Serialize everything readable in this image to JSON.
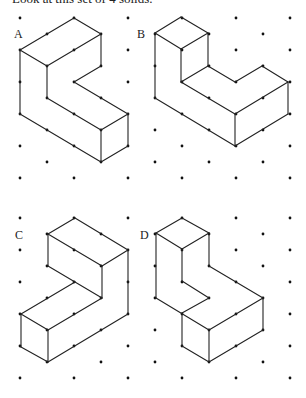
{
  "heading": "Look at this set of 4 solids.",
  "colors": {
    "line": "#222222",
    "dot": "#111111",
    "background": "#ffffff"
  },
  "lattice": {
    "x0": 20,
    "dx": 27,
    "columns": 11,
    "blocks": [
      {
        "y0": 18,
        "rows": 6
      },
      {
        "y0": 218,
        "rows": 6
      }
    ],
    "dy": 32
  },
  "figures": [
    {
      "id": "A",
      "label": "A",
      "label_pos": [
        14,
        38
      ],
      "edges": [
        [
          [
            20,
            50
          ],
          [
            74,
            18
          ]
        ],
        [
          [
            74,
            18
          ],
          [
            101,
            34
          ]
        ],
        [
          [
            101,
            34
          ],
          [
            47,
            66
          ]
        ],
        [
          [
            47,
            66
          ],
          [
            20,
            50
          ]
        ],
        [
          [
            101,
            34
          ],
          [
            101,
            66
          ]
        ],
        [
          [
            47,
            66
          ],
          [
            47,
            98
          ]
        ],
        [
          [
            101,
            66
          ],
          [
            74,
            82
          ]
        ],
        [
          [
            74,
            82
          ],
          [
            128,
            114
          ]
        ],
        [
          [
            47,
            98
          ],
          [
            101,
            130
          ]
        ],
        [
          [
            101,
            130
          ],
          [
            128,
            114
          ]
        ],
        [
          [
            128,
            114
          ],
          [
            128,
            146
          ]
        ],
        [
          [
            101,
            130
          ],
          [
            101,
            162
          ]
        ],
        [
          [
            101,
            162
          ],
          [
            128,
            146
          ]
        ],
        [
          [
            20,
            50
          ],
          [
            20,
            114
          ]
        ],
        [
          [
            20,
            114
          ],
          [
            101,
            162
          ]
        ]
      ]
    },
    {
      "id": "B",
      "label": "B",
      "label_pos": [
        137,
        38
      ],
      "edges": [
        [
          [
            155,
            33
          ],
          [
            181,
            17
          ]
        ],
        [
          [
            181,
            17
          ],
          [
            208,
            33
          ]
        ],
        [
          [
            208,
            33
          ],
          [
            181,
            49
          ]
        ],
        [
          [
            181,
            49
          ],
          [
            155,
            33
          ]
        ],
        [
          [
            181,
            49
          ],
          [
            181,
            82
          ]
        ],
        [
          [
            208,
            33
          ],
          [
            208,
            66
          ]
        ],
        [
          [
            155,
            33
          ],
          [
            155,
            98
          ]
        ],
        [
          [
            208,
            66
          ],
          [
            181,
            82
          ]
        ],
        [
          [
            208,
            66
          ],
          [
            235,
            82
          ]
        ],
        [
          [
            235,
            82
          ],
          [
            262,
            66
          ]
        ],
        [
          [
            262,
            66
          ],
          [
            288,
            82
          ]
        ],
        [
          [
            181,
            82
          ],
          [
            235,
            114
          ]
        ],
        [
          [
            235,
            114
          ],
          [
            288,
            82
          ]
        ],
        [
          [
            288,
            82
          ],
          [
            288,
            114
          ]
        ],
        [
          [
            235,
            114
          ],
          [
            235,
            146
          ]
        ],
        [
          [
            288,
            114
          ],
          [
            235,
            146
          ]
        ],
        [
          [
            155,
            98
          ],
          [
            235,
            146
          ]
        ]
      ]
    },
    {
      "id": "C",
      "label": "C",
      "label_pos": [
        15,
        239
      ],
      "edges": [
        [
          [
            48,
            234
          ],
          [
            75,
            218
          ]
        ],
        [
          [
            75,
            218
          ],
          [
            128,
            250
          ]
        ],
        [
          [
            128,
            250
          ],
          [
            102,
            266
          ]
        ],
        [
          [
            102,
            266
          ],
          [
            48,
            234
          ]
        ],
        [
          [
            48,
            234
          ],
          [
            48,
            266
          ]
        ],
        [
          [
            48,
            266
          ],
          [
            75,
            282
          ]
        ],
        [
          [
            102,
            266
          ],
          [
            102,
            298
          ]
        ],
        [
          [
            128,
            250
          ],
          [
            128,
            314
          ]
        ],
        [
          [
            75,
            282
          ],
          [
            102,
            298
          ]
        ],
        [
          [
            75,
            282
          ],
          [
            21,
            314
          ]
        ],
        [
          [
            102,
            298
          ],
          [
            48,
            330
          ]
        ],
        [
          [
            21,
            314
          ],
          [
            48,
            330
          ]
        ],
        [
          [
            21,
            314
          ],
          [
            21,
            347
          ]
        ],
        [
          [
            48,
            330
          ],
          [
            48,
            362
          ]
        ],
        [
          [
            21,
            347
          ],
          [
            48,
            362
          ]
        ],
        [
          [
            48,
            362
          ],
          [
            128,
            314
          ]
        ]
      ]
    },
    {
      "id": "D",
      "label": "D",
      "label_pos": [
        140,
        239
      ],
      "edges": [
        [
          [
            156,
            233
          ],
          [
            182,
            218
          ]
        ],
        [
          [
            182,
            218
          ],
          [
            209,
            233
          ]
        ],
        [
          [
            209,
            233
          ],
          [
            182,
            249
          ]
        ],
        [
          [
            182,
            249
          ],
          [
            156,
            233
          ]
        ],
        [
          [
            156,
            233
          ],
          [
            156,
            298
          ]
        ],
        [
          [
            182,
            249
          ],
          [
            182,
            281
          ]
        ],
        [
          [
            209,
            233
          ],
          [
            209,
            266
          ]
        ],
        [
          [
            182,
            281
          ],
          [
            209,
            298
          ]
        ],
        [
          [
            209,
            298
          ],
          [
            182,
            313
          ]
        ],
        [
          [
            156,
            298
          ],
          [
            209,
            330
          ]
        ],
        [
          [
            209,
            266
          ],
          [
            263,
            298
          ]
        ],
        [
          [
            182,
            313
          ],
          [
            182,
            346
          ]
        ],
        [
          [
            209,
            330
          ],
          [
            263,
            298
          ]
        ],
        [
          [
            263,
            298
          ],
          [
            263,
            330
          ]
        ],
        [
          [
            209,
            330
          ],
          [
            209,
            362
          ]
        ],
        [
          [
            182,
            346
          ],
          [
            209,
            362
          ]
        ],
        [
          [
            209,
            362
          ],
          [
            263,
            330
          ]
        ]
      ]
    }
  ]
}
